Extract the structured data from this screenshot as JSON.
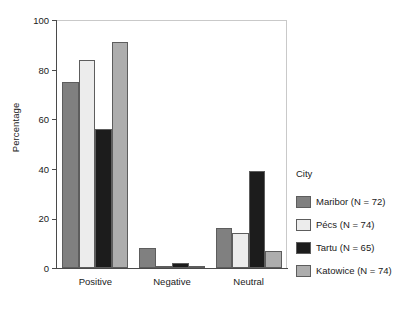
{
  "chart_data": {
    "type": "bar",
    "title": "",
    "xlabel": "",
    "ylabel": "Percentage",
    "categories": [
      "Positive",
      "Negative",
      "Neutral"
    ],
    "ylim": [
      0,
      100
    ],
    "yticks": [
      0,
      20,
      40,
      60,
      80,
      100
    ],
    "grid": false,
    "legend_position": "right",
    "legend_title": "City",
    "series": [
      {
        "name": "Maribor (N = 72)",
        "color": "#808080",
        "values": [
          75,
          8,
          16
        ]
      },
      {
        "name": "Pécs (N = 74)",
        "color": "#ececec",
        "values": [
          84,
          0.6,
          14
        ]
      },
      {
        "name": "Tartu (N = 65)",
        "color": "#1c1c1c",
        "values": [
          56,
          2,
          39
        ]
      },
      {
        "name": "Katowice (N = 74)",
        "color": "#adadad",
        "values": [
          91,
          0,
          7
        ]
      }
    ]
  }
}
